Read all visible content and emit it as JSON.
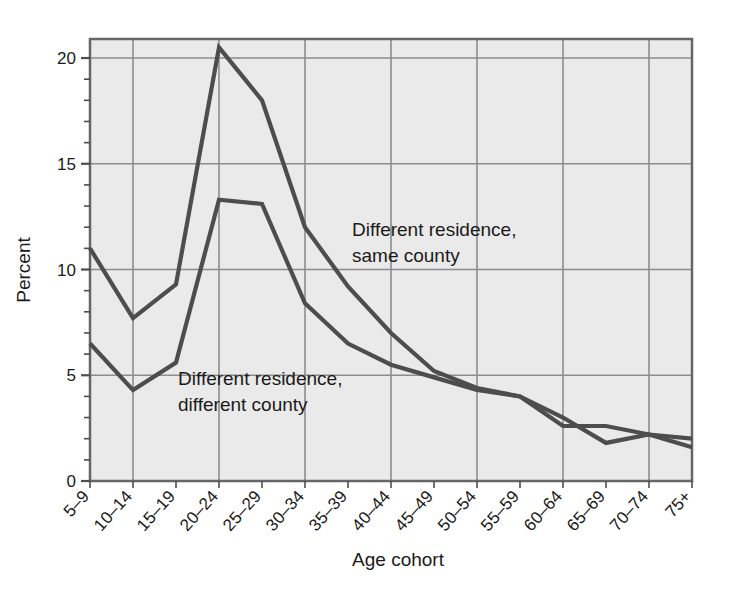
{
  "chart_data": {
    "type": "line",
    "title": "",
    "xlabel": "Age cohort",
    "ylabel": "Percent",
    "categories": [
      "5–9",
      "10–14",
      "15–19",
      "20–24",
      "25–29",
      "30–34",
      "35–39",
      "40–44",
      "45–49",
      "50–54",
      "55–59",
      "60–64",
      "65–69",
      "70–74",
      "75+"
    ],
    "series": [
      {
        "name": "Different residence, same county",
        "values": [
          11.0,
          7.7,
          9.3,
          20.5,
          18.0,
          12.0,
          9.2,
          7.0,
          5.2,
          4.4,
          4.0,
          2.6,
          2.6,
          2.2,
          2.0
        ],
        "color": "#4d4d4d"
      },
      {
        "name": "Different residence, different county",
        "values": [
          6.5,
          4.3,
          5.6,
          13.3,
          13.1,
          8.4,
          6.5,
          5.5,
          4.9,
          4.3,
          4.0,
          3.0,
          1.8,
          2.2,
          1.6
        ],
        "color": "#4d4d4d"
      }
    ],
    "ylim": [
      0,
      20.9
    ],
    "yticks": [
      0,
      5,
      10,
      15,
      20
    ],
    "ytick_labels": [
      "0",
      "5",
      "10",
      "15",
      "20"
    ],
    "yminor_step": 1,
    "grid": true,
    "grid_x_every": 2,
    "legend_position": "inline-annotations",
    "annotations": [
      {
        "id": "same-county",
        "line1": "Different residence,",
        "line2": "same county"
      },
      {
        "id": "different-county",
        "line1": "Different residence,",
        "line2": "different county"
      }
    ],
    "plot_bg": "#eaeaea",
    "grid_color": "#8c8c8c",
    "frame_color": "#666666"
  }
}
